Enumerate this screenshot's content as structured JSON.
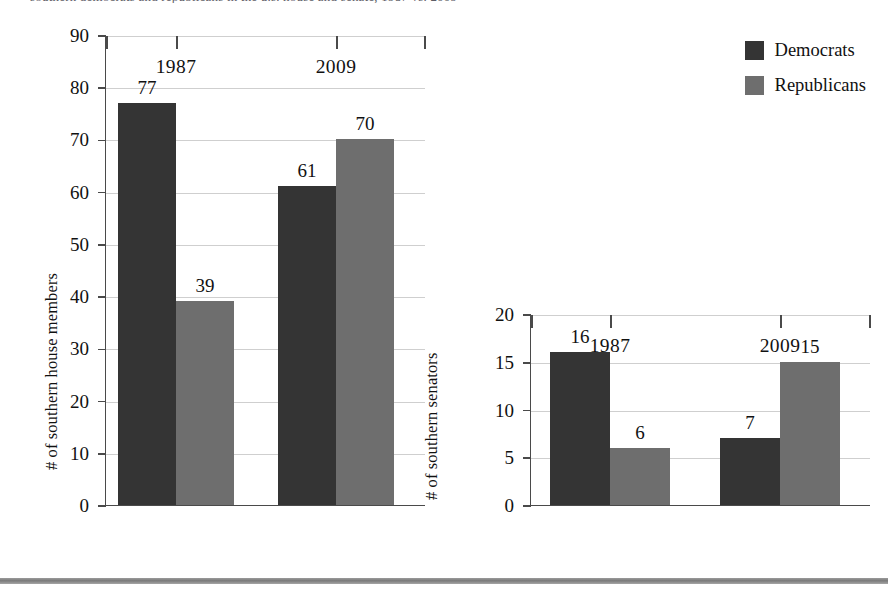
{
  "page": {
    "clipped_caption_text": "southern democrats and republicans in the u.s. house and senate, 1987 vs. 2009",
    "bottom_rule_color": "#7a7a7a",
    "background": "#ffffff"
  },
  "legend": {
    "items": [
      {
        "label": "Democrats",
        "color": "#343434"
      },
      {
        "label": "Republicans",
        "color": "#6e6e6e"
      }
    ]
  },
  "chart_data": [
    {
      "id": "house",
      "type": "bar",
      "title": "",
      "xlabel": "",
      "ylabel": "# of southern house members",
      "categories": [
        "1987",
        "2009"
      ],
      "ylim": [
        0,
        90
      ],
      "yticks": [
        0,
        10,
        20,
        30,
        40,
        50,
        60,
        70,
        80,
        90
      ],
      "ytick_labels": [
        "0",
        "10",
        "20",
        "30",
        "40",
        "50",
        "60",
        "70",
        "80",
        "90"
      ],
      "grid": true,
      "legend_position": "top-right",
      "series": [
        {
          "name": "Democrats",
          "color": "#343434",
          "values": [
            77,
            61
          ],
          "value_labels": [
            "77",
            "61"
          ]
        },
        {
          "name": "Republicans",
          "color": "#6e6e6e",
          "values": [
            39,
            70
          ],
          "value_labels": [
            "39",
            "70"
          ]
        }
      ]
    },
    {
      "id": "senate",
      "type": "bar",
      "title": "",
      "xlabel": "",
      "ylabel": "# of southern senators",
      "categories": [
        "1987",
        "2009"
      ],
      "ylim": [
        0,
        20
      ],
      "yticks": [
        0,
        5,
        10,
        15,
        20
      ],
      "ytick_labels": [
        "0",
        "5",
        "10",
        "15",
        "20"
      ],
      "grid": true,
      "legend_position": "none",
      "series": [
        {
          "name": "Democrats",
          "color": "#343434",
          "values": [
            16,
            7
          ],
          "value_labels": [
            "16",
            "7"
          ]
        },
        {
          "name": "Republicans",
          "color": "#6e6e6e",
          "values": [
            6,
            15
          ],
          "value_labels": [
            "6",
            "15"
          ]
        }
      ]
    }
  ]
}
